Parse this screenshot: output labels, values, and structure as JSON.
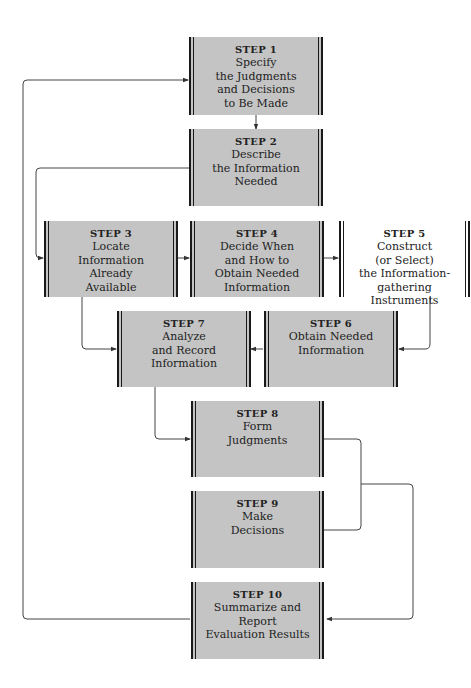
{
  "diagram": {
    "steps": [
      {
        "id": 1,
        "label": "STEP 1",
        "text": "Specify\nthe Judgments\nand Decisions\nto Be Made",
        "fill": "gray"
      },
      {
        "id": 2,
        "label": "STEP 2",
        "text": "Describe\nthe Information\nNeeded",
        "fill": "gray"
      },
      {
        "id": 3,
        "label": "STEP 3",
        "text": "Locate\nInformation\nAlready\nAvailable",
        "fill": "gray"
      },
      {
        "id": 4,
        "label": "STEP 4",
        "text": "Decide When\nand How to\nObtain Needed\nInformation",
        "fill": "gray"
      },
      {
        "id": 5,
        "label": "STEP 5",
        "text": "Construct\n(or Select)\nthe Information-\ngathering\nInstruments",
        "fill": "white"
      },
      {
        "id": 6,
        "label": "STEP 6",
        "text": "Obtain Needed\nInformation",
        "fill": "gray"
      },
      {
        "id": 7,
        "label": "STEP 7",
        "text": "Analyze\nand Record\nInformation",
        "fill": "gray"
      },
      {
        "id": 8,
        "label": "STEP 8",
        "text": "Form\nJudgments",
        "fill": "gray"
      },
      {
        "id": 9,
        "label": "STEP 9",
        "text": "Make\nDecisions",
        "fill": "gray"
      },
      {
        "id": 10,
        "label": "STEP 10",
        "text": "Summarize and\nReport\nEvaluation Results",
        "fill": "gray"
      }
    ],
    "connections": [
      {
        "from": 1,
        "to": 2
      },
      {
        "from": 2,
        "to": 3
      },
      {
        "from": 3,
        "to": 4
      },
      {
        "from": 4,
        "to": 5
      },
      {
        "from": 5,
        "to": 6
      },
      {
        "from": 6,
        "to": 7
      },
      {
        "from": 3,
        "to": 7
      },
      {
        "from": 7,
        "to": 8
      },
      {
        "from": 8,
        "to": 10
      },
      {
        "from": 9,
        "to": 10
      },
      {
        "from": 10,
        "to": 1
      }
    ],
    "colors": {
      "box_fill": "#c4c4c4",
      "box_border": "#1a1a1a",
      "line": "#333333"
    }
  }
}
